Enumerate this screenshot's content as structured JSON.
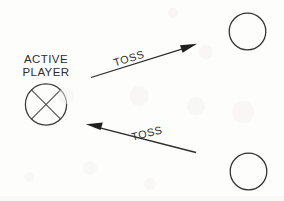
{
  "diagram": {
    "background_color": "#fdfdfc",
    "stroke_color": "#2b2b2b",
    "text_color": "#2e2e2e",
    "width": 284,
    "height": 201,
    "active_player": {
      "label_line1": "ACTIVE",
      "label_line2": "PLAYER",
      "marker": "circle-with-x",
      "center_x": 46,
      "center_y": 104,
      "radius": 21
    },
    "arrows": [
      {
        "name": "toss-arrow-upper",
        "label": "TOSS",
        "direction": "up-right",
        "tail_x": 91,
        "tail_y": 77,
        "tip_x": 197,
        "tip_y": 44,
        "label_rotation_deg": -17
      },
      {
        "name": "toss-arrow-lower",
        "label": "TOSS",
        "direction": "up-left",
        "tail_x": 196,
        "tail_y": 152,
        "tip_x": 86,
        "tip_y": 124,
        "label_rotation_deg": -14
      }
    ],
    "receiver_circles": [
      {
        "name": "receiver-circle-top",
        "center_x": 247,
        "center_y": 31,
        "radius": 18.5
      },
      {
        "name": "receiver-circle-bottom",
        "center_x": 248,
        "center_y": 171,
        "radius": 18.5
      }
    ]
  }
}
